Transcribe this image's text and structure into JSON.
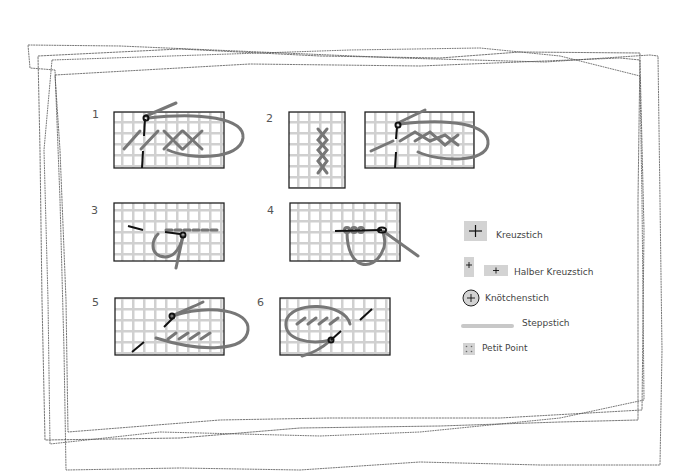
{
  "diagram": {
    "type": "stitch-instruction-sheet",
    "panels": [
      {
        "number": "1",
        "description": "Kreuzstich - half stitches then crossed"
      },
      {
        "number": "2",
        "description": "Kreuzstich vertical rows"
      },
      {
        "number": "3",
        "description": "Steppstich"
      },
      {
        "number": "4",
        "description": "Knötchenstich"
      },
      {
        "number": "5",
        "description": "Halber Kreuzstich"
      },
      {
        "number": "6",
        "description": "Petit Point"
      }
    ],
    "legend": {
      "items": [
        {
          "icon": "cross-square-icon",
          "label": "Kreuzstich"
        },
        {
          "icon": "half-cross-icon",
          "label": "Halber Kreuzstich"
        },
        {
          "icon": "knot-circle-icon",
          "label": "Knötchenstich"
        },
        {
          "icon": "line-bar-icon",
          "label": "Steppstich"
        },
        {
          "icon": "dots-square-icon",
          "label": "Petit Point"
        }
      ]
    },
    "colors": {
      "grid_line": "#cccccc",
      "grid_border": "#222222",
      "thread": "#777777",
      "needle": "#111111",
      "legend_fill": "#d3d3d3",
      "frame_stroke": "#444444"
    }
  }
}
